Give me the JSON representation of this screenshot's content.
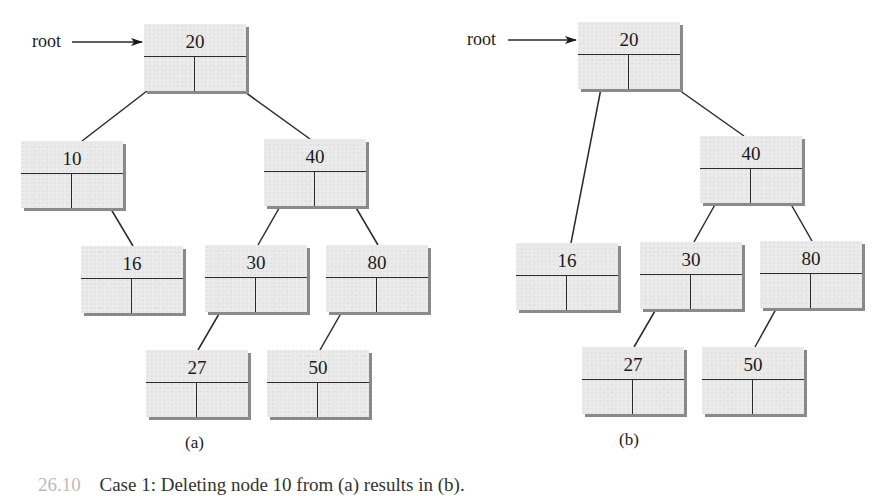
{
  "diagram": {
    "type": "binary-search-tree-deletion",
    "colors": {
      "node_fill": "#ebebeb",
      "node_shadow": "#8a8a8a",
      "line": "#2a2a2a"
    },
    "trees": [
      {
        "id": "a",
        "label": "(a)",
        "root_label": "root",
        "nodes": [
          {
            "id": "a20",
            "value": "20"
          },
          {
            "id": "a10",
            "value": "10"
          },
          {
            "id": "a40",
            "value": "40"
          },
          {
            "id": "a16",
            "value": "16"
          },
          {
            "id": "a30",
            "value": "30"
          },
          {
            "id": "a80",
            "value": "80"
          },
          {
            "id": "a27",
            "value": "27"
          },
          {
            "id": "a50",
            "value": "50"
          }
        ],
        "edges": [
          {
            "from": "20",
            "to": "10",
            "side": "left"
          },
          {
            "from": "20",
            "to": "40",
            "side": "right"
          },
          {
            "from": "10",
            "to": "16",
            "side": "right"
          },
          {
            "from": "40",
            "to": "30",
            "side": "left"
          },
          {
            "from": "40",
            "to": "80",
            "side": "right"
          },
          {
            "from": "30",
            "to": "27",
            "side": "left"
          },
          {
            "from": "80",
            "to": "50",
            "side": "left"
          }
        ]
      },
      {
        "id": "b",
        "label": "(b)",
        "root_label": "root",
        "nodes": [
          {
            "id": "b20",
            "value": "20"
          },
          {
            "id": "b40",
            "value": "40"
          },
          {
            "id": "b16",
            "value": "16"
          },
          {
            "id": "b30",
            "value": "30"
          },
          {
            "id": "b80",
            "value": "80"
          },
          {
            "id": "b27",
            "value": "27"
          },
          {
            "id": "b50",
            "value": "50"
          }
        ],
        "edges": [
          {
            "from": "20",
            "to": "16",
            "side": "left"
          },
          {
            "from": "20",
            "to": "40",
            "side": "right"
          },
          {
            "from": "40",
            "to": "30",
            "side": "left"
          },
          {
            "from": "40",
            "to": "80",
            "side": "right"
          },
          {
            "from": "30",
            "to": "27",
            "side": "left"
          },
          {
            "from": "80",
            "to": "50",
            "side": "left"
          }
        ]
      }
    ],
    "caption": {
      "figure_number": "26.10",
      "text": "Case 1: Deleting node 10 from (a) results in (b)."
    }
  }
}
